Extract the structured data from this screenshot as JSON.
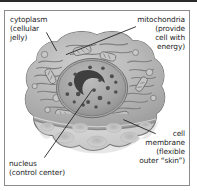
{
  "figure": {
    "kind": "animal-cell-cutaway-diagram",
    "style": "grayscale textbook illustration",
    "frame_border_color": "#8c8c8c",
    "background_color": "#ffffff",
    "text_color": "#1d1d1d"
  },
  "labels": {
    "cytoplasm": {
      "name": "cytoplasm",
      "text": "cytoplasm\n(cellular\njelly)",
      "align": "left"
    },
    "mitochondria": {
      "name": "mitochondria",
      "text": "mitochondria\n(provide\ncell with\nenergy)",
      "align": "right"
    },
    "cell_membrane": {
      "name": "cell membrane",
      "text": "cell\nmembrane\n(flexible\nouter “skin”)",
      "align": "right"
    },
    "nucleus": {
      "name": "nucleus",
      "text": "nucleus\n(control center)",
      "align": "left"
    }
  },
  "cell_parts": [
    "cytoplasm",
    "mitochondria",
    "cell membrane",
    "nucleus"
  ],
  "colors": {
    "cytoplasm_fill": "#b9b9b9",
    "cytoplasm_dark": "#9a9a9a",
    "membrane_fill": "#d9d9d9",
    "membrane_light": "#e8e8e8",
    "nucleus_fill": "#a5a5a5",
    "nucleolus": "#3f3f3f",
    "outline": "#5a5a5a",
    "leader_line": "#2a2a2a"
  }
}
